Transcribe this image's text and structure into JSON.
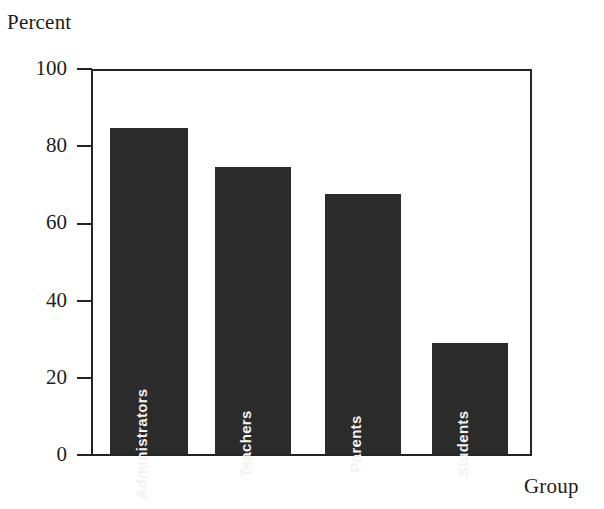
{
  "chart_data": {
    "type": "bar",
    "title": "",
    "categories": [
      "Administrators",
      "Teachers",
      "Parents",
      "Students"
    ],
    "values": [
      85,
      75,
      68,
      29
    ],
    "xlabel": "Group",
    "ylabel": "Percent",
    "ylim": [
      0,
      100
    ],
    "yticks": [
      0,
      20,
      40,
      60,
      80,
      100
    ],
    "ytick_labels": [
      "0",
      "20",
      "40",
      "60",
      "80",
      "100"
    ],
    "grid": false,
    "legend": null,
    "series": [
      {
        "name": "Percent",
        "values": [
          85,
          75,
          68,
          29
        ],
        "color": "#2b2b2b"
      }
    ],
    "bar_labels_inside": true,
    "bar_label_rotation": -90,
    "bar_label_color": "#f2f2f2"
  },
  "colors": {
    "bar_fill": "#2b2b2b",
    "axis": "#242424",
    "text": "#1d1d1d",
    "background": "#ffffff"
  }
}
